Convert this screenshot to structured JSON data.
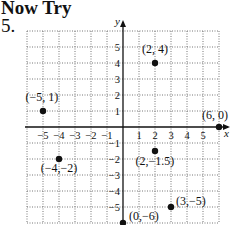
{
  "header": {
    "title": "Now Try",
    "exercise_number": "5."
  },
  "chart_data": {
    "type": "scatter",
    "title": "",
    "xlabel": "x",
    "ylabel": "y",
    "xlim": [
      -6,
      6
    ],
    "ylim": [
      -6,
      6
    ],
    "grid": true,
    "x_ticks": [
      -5,
      -4,
      -3,
      -2,
      -1,
      1,
      2,
      3,
      4,
      5
    ],
    "y_ticks": [
      5,
      4,
      3,
      2,
      1,
      -1,
      -2,
      -3,
      -4,
      -5
    ],
    "x_tick_labels": [
      "−5",
      "−4",
      "−3",
      "−2",
      "−1",
      "1",
      "2",
      "3",
      "4",
      "5"
    ],
    "y_tick_labels": [
      "5",
      "4",
      "3",
      "2",
      "1",
      "−1",
      "−2",
      "−3",
      "−4",
      "−5"
    ],
    "points": [
      {
        "x": 2,
        "y": 4,
        "label": "(2, 4)"
      },
      {
        "x": -5,
        "y": 1,
        "label": "(−5, 1)"
      },
      {
        "x": 6,
        "y": 0,
        "label": "(6, 0)"
      },
      {
        "x": -4,
        "y": -2,
        "label": "(−4,−2)"
      },
      {
        "x": 2,
        "y": -1.5,
        "label": "(2,−1.5)"
      },
      {
        "x": 3,
        "y": -5,
        "label": "(3,−5)"
      },
      {
        "x": 0,
        "y": -6,
        "label": "(0,−6)"
      }
    ],
    "legend": null
  }
}
